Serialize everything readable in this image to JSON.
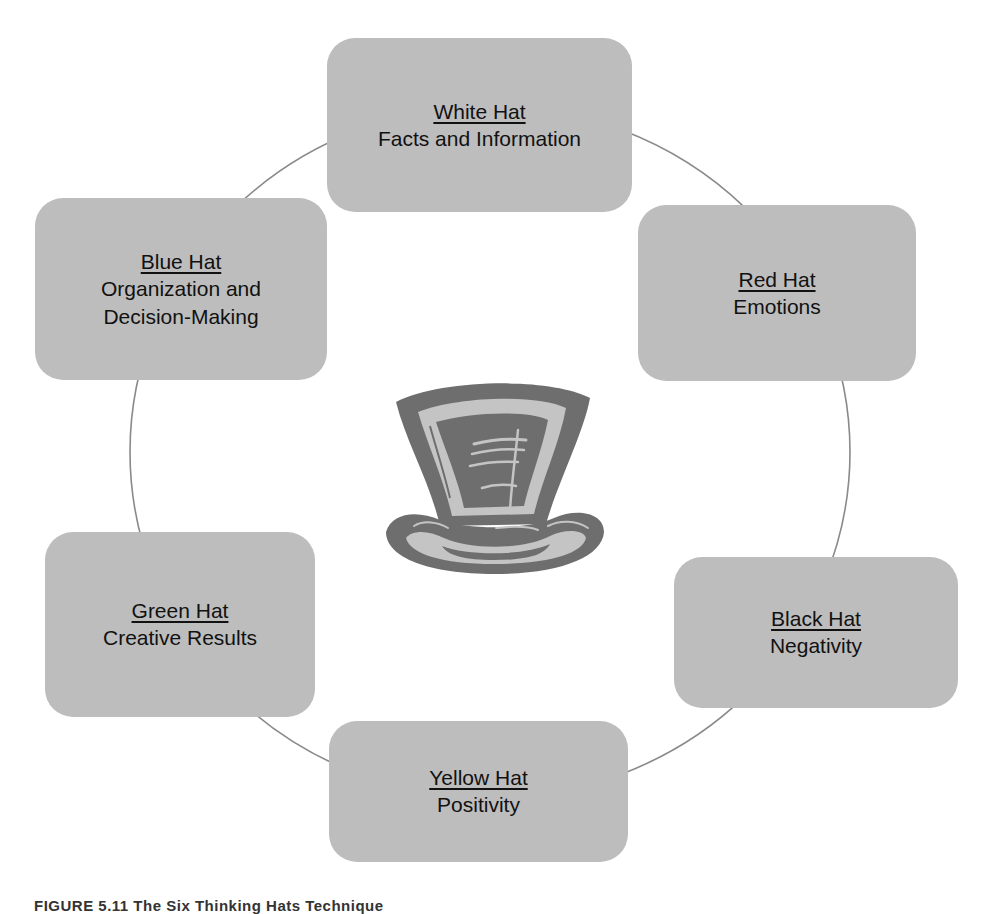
{
  "diagram": {
    "type": "cycle",
    "center_icon": "top-hat-icon",
    "colors": {
      "box_fill": "#bdbdbd",
      "connector": "#8a8a8a",
      "hat_dark": "#6e6e6e",
      "hat_light": "#c4c4c4",
      "text": "#111111"
    },
    "hats": [
      {
        "id": "white",
        "title": "White Hat",
        "description": "Facts and Information"
      },
      {
        "id": "red",
        "title": "Red Hat",
        "description": "Emotions"
      },
      {
        "id": "black",
        "title": "Black Hat",
        "description": "Negativity"
      },
      {
        "id": "yellow",
        "title": "Yellow Hat",
        "description": "Positivity"
      },
      {
        "id": "green",
        "title": "Green Hat",
        "description": "Creative Results"
      },
      {
        "id": "blue",
        "title": "Blue Hat",
        "description": "Organization and\nDecision-Making"
      }
    ]
  },
  "caption": "FIGURE 5.11  The Six Thinking Hats Technique"
}
